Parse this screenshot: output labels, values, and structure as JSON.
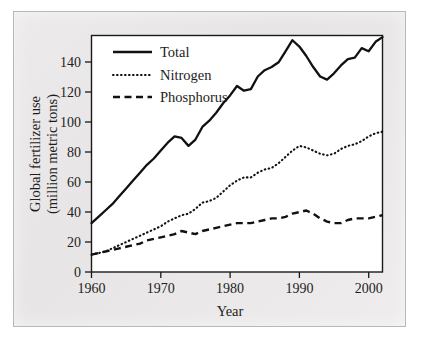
{
  "chart_data": {
    "type": "line",
    "title": "",
    "xlabel": "Year",
    "ylabel": "Global fertilizer use (million metric tons)",
    "ylabel_line1": "Global fertilizer use",
    "ylabel_line2": "(million metric tons)",
    "xlim": [
      1960,
      2002
    ],
    "ylim": [
      0,
      150
    ],
    "xticks": [
      1960,
      1970,
      1980,
      1990,
      2000
    ],
    "yticks": [
      0,
      20,
      40,
      60,
      80,
      100,
      120,
      140
    ],
    "grid": false,
    "legend_position": "top-left",
    "x": [
      1960,
      1961,
      1962,
      1963,
      1964,
      1965,
      1966,
      1967,
      1968,
      1969,
      1970,
      1971,
      1972,
      1973,
      1974,
      1975,
      1976,
      1977,
      1978,
      1979,
      1980,
      1981,
      1982,
      1983,
      1984,
      1985,
      1986,
      1987,
      1988,
      1989,
      1990,
      1991,
      1992,
      1993,
      1994,
      1995,
      1996,
      1997,
      1998,
      1999,
      2000,
      2001,
      2002
    ],
    "series": [
      {
        "name": "Total",
        "style": "solid",
        "values": [
          31,
          35,
          39,
          43,
          48,
          53,
          58,
          63,
          68,
          72,
          77,
          82,
          86,
          85,
          80,
          84,
          92,
          96,
          101,
          107,
          112,
          118,
          115,
          116,
          124,
          128,
          130,
          133,
          140,
          147,
          143,
          137,
          130,
          124,
          122,
          126,
          131,
          135,
          136,
          142,
          140,
          146,
          149
        ]
      },
      {
        "name": "Nitrogen",
        "style": "dotted",
        "values": [
          11,
          12,
          13,
          15,
          17,
          19,
          21,
          23,
          25,
          27,
          29,
          32,
          34,
          36,
          37,
          40,
          44,
          45,
          47,
          51,
          55,
          58,
          60,
          60,
          63,
          65,
          66,
          69,
          73,
          77,
          80,
          79,
          77,
          75,
          74,
          75,
          78,
          80,
          81,
          83,
          86,
          88,
          89
        ]
      },
      {
        "name": "Phosphorus",
        "style": "dashed",
        "values": [
          11,
          12,
          13,
          14,
          15,
          16,
          17,
          18,
          20,
          21,
          22,
          23,
          24,
          26,
          25,
          24,
          26,
          27,
          28,
          29,
          30,
          31,
          31,
          31,
          32,
          33,
          34,
          34,
          35,
          37,
          38,
          39,
          37,
          34,
          32,
          31,
          31,
          33,
          34,
          34,
          34,
          35,
          36
        ]
      }
    ],
    "legend": [
      {
        "label": "Total",
        "style": "solid"
      },
      {
        "label": "Nitrogen",
        "style": "dotted"
      },
      {
        "label": "Phosphorus",
        "style": "dashed"
      }
    ],
    "colors": {
      "line": "#111111",
      "panel": "#ebe9e9",
      "plot_background": "#ffffff",
      "text": "#1d1d1d"
    }
  }
}
